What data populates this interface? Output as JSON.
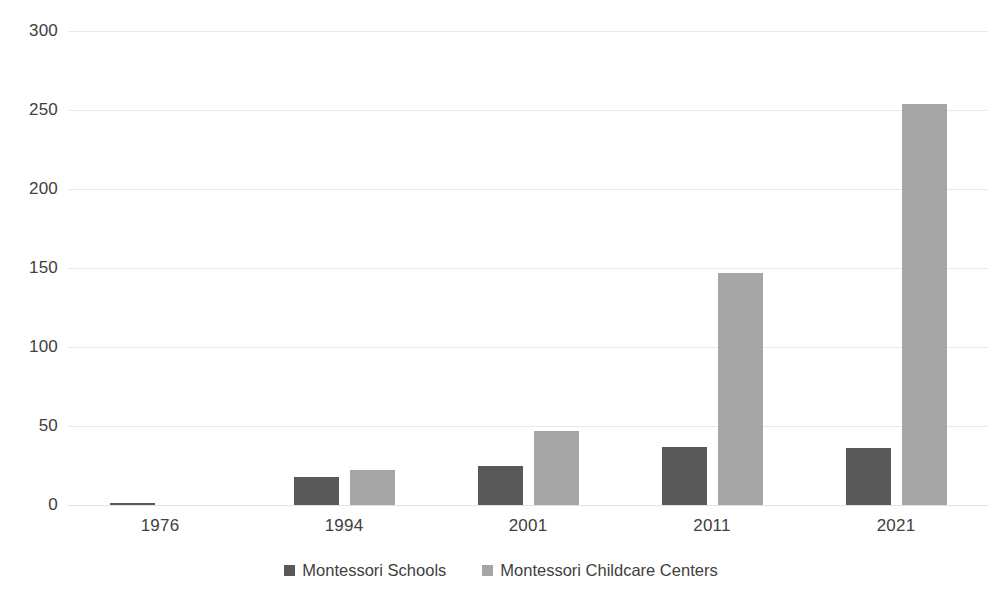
{
  "chart_data": {
    "type": "bar",
    "title": "",
    "subtitle": "",
    "xlabel": "",
    "ylabel": "",
    "categories": [
      "1976",
      "1994",
      "2001",
      "2011",
      "2021"
    ],
    "series": [
      {
        "name": "Montessori Schools",
        "color": "#595959",
        "values": [
          1.5,
          18,
          25,
          37,
          36
        ]
      },
      {
        "name": "Montessori Childcare Centers",
        "color": "#a5a5a5",
        "values": [
          0,
          22,
          47,
          147,
          254
        ]
      }
    ],
    "ylim": [
      0,
      300
    ],
    "yticks": [
      0,
      50,
      100,
      150,
      200,
      250,
      300
    ],
    "ytick_labels": [
      "0",
      "50",
      "100",
      "150",
      "200",
      "250",
      "300"
    ],
    "grid": true,
    "grid_axis": "y",
    "legend_position": "bottom",
    "bar_group_gap": true
  }
}
